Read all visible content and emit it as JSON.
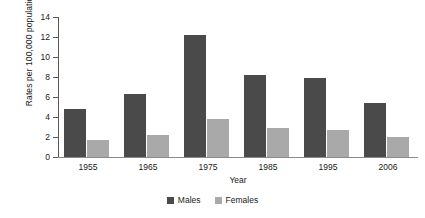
{
  "chart_data": {
    "type": "bar",
    "title": "",
    "subtitle": "",
    "xlabel": "Year",
    "ylabel": "Rates per 100,000 population",
    "categories": [
      "1955",
      "1965",
      "1975",
      "1985",
      "1995",
      "2006"
    ],
    "series": [
      {
        "name": "Males",
        "color": "#4a4a4a",
        "values": [
          4.8,
          6.3,
          12.2,
          8.2,
          7.9,
          5.4
        ]
      },
      {
        "name": "Females",
        "color": "#a9a9a9",
        "values": [
          1.75,
          2.2,
          3.85,
          2.95,
          2.75,
          2.0
        ]
      }
    ],
    "ylim": [
      0,
      14
    ],
    "ytick_labels": [
      "0",
      "2",
      "4",
      "6",
      "8",
      "10",
      "12",
      "14"
    ],
    "ytick_values": [
      0,
      2,
      4,
      6,
      8,
      10,
      12,
      14
    ],
    "grid": false,
    "legend_position": "bottom",
    "axis_color": "#5a5a5a",
    "background": "#ffffff"
  }
}
